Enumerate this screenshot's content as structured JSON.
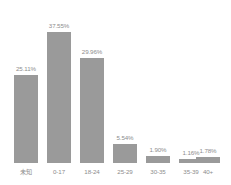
{
  "chart_data": {
    "type": "bar",
    "title": "",
    "subtitle": "",
    "xlabel": "",
    "ylabel": "",
    "ylim": [
      0,
      40
    ],
    "grid": false,
    "legend": "none",
    "axis_lines": false,
    "value_label_format": "percent",
    "categories": [
      "未知",
      "0-17",
      "18-24",
      "25-29",
      "30-35",
      "35-39",
      "40+"
    ],
    "values": [
      25.11,
      37.55,
      29.96,
      5.54,
      1.9,
      1.16,
      1.78
    ],
    "value_labels": [
      "25.11%",
      "37.55%",
      "29.96%",
      "5.54%",
      "1.90%",
      "1.16%",
      "1.78%"
    ],
    "series": [
      {
        "name": "",
        "values": [
          25.11,
          37.55,
          29.96,
          5.54,
          1.9,
          1.16,
          1.78
        ]
      }
    ]
  },
  "style": {
    "bar_color": "#9a9a9a",
    "text_color": "#8d8d8d",
    "background": "#ffffff"
  }
}
